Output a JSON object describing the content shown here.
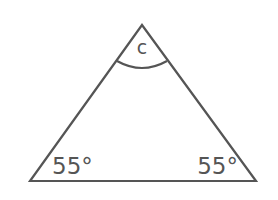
{
  "diagram": {
    "type": "triangle",
    "stroke_color": "#555555",
    "background": "#ffffff",
    "vertices": {
      "apex": {
        "x": 142,
        "y": 25
      },
      "bottom_left": {
        "x": 30,
        "y": 181
      },
      "bottom_right": {
        "x": 256,
        "y": 181
      }
    },
    "angles": {
      "top": {
        "label": "c",
        "marked_with_arc": true
      },
      "bottom_left": {
        "label": "55°",
        "marked_with_arc": false
      },
      "bottom_right": {
        "label": "55°",
        "marked_with_arc": false
      }
    }
  }
}
